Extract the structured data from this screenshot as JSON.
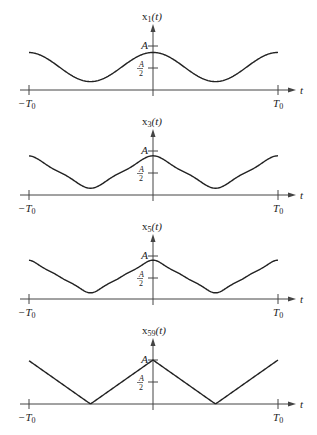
{
  "figure": {
    "panels": [
      {
        "label": "x",
        "subscript": "1",
        "arg": "(t)",
        "harmonics": 1,
        "axis_y": 90,
        "a_y": 46,
        "half_y": 68,
        "shape": "cos1"
      },
      {
        "label": "x",
        "subscript": "3",
        "arg": "(t)",
        "harmonics": 3,
        "axis_y": 195,
        "a_y": 151,
        "half_y": 173,
        "shape": "sum3"
      },
      {
        "label": "x",
        "subscript": "5",
        "arg": "(t)",
        "harmonics": 5,
        "axis_y": 299,
        "a_y": 256,
        "half_y": 278,
        "shape": "sum5"
      },
      {
        "label": "x",
        "subscript": "59",
        "arg": "(t)",
        "harmonics": 59,
        "axis_y": 404,
        "a_y": 360,
        "half_y": 382,
        "shape": "triangle"
      }
    ],
    "axis": {
      "t_label": "t",
      "left_tick_main": "−T",
      "left_tick_sub": "0",
      "right_tick_main": "T",
      "right_tick_sub": "0",
      "a_label": "A",
      "half_num": "A",
      "half_den": "2"
    },
    "colors": {
      "line": "#222222",
      "axis": "#444444"
    }
  }
}
